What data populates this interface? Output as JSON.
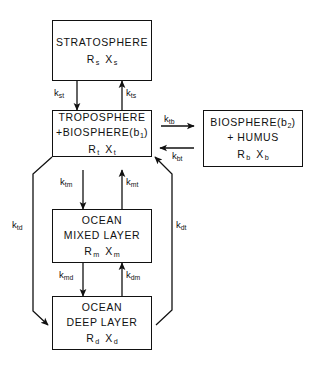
{
  "diagram": {
    "type": "box-and-arrow compartment model",
    "nodes": [
      {
        "id": "stratosphere",
        "name": "STRATOSPHERE",
        "lines": [
          "STRATOSPHERE"
        ],
        "reservoir_symbol": "R",
        "reservoir_sub": "s",
        "tracer_symbol": "X",
        "tracer_sub": "s"
      },
      {
        "id": "troposphere",
        "name": "TROPOSPHERE +BIOSPHERE(b1)",
        "lines": [
          "TROPOSPHERE",
          "+BIOSPHERE(b"
        ],
        "line1": "TROPOSPHERE",
        "line2_pre": "+BIOSPHERE(b",
        "line2_sub": "1",
        "line2_post": ")",
        "reservoir_symbol": "R",
        "reservoir_sub": "t",
        "tracer_symbol": "X",
        "tracer_sub": "t"
      },
      {
        "id": "biosphere",
        "name": "BIOSPHERE(b2) + HUMUS",
        "line1_pre": "BIOSPHERE(b",
        "line1_sub": "2",
        "line1_post": ")",
        "line2": "+ HUMUS",
        "reservoir_symbol": "R",
        "reservoir_sub": "b",
        "tracer_symbol": "X",
        "tracer_sub": "b"
      },
      {
        "id": "ocean-mixed-layer",
        "name": "OCEAN MIXED LAYER",
        "line1": "OCEAN",
        "line2": "MIXED  LAYER",
        "reservoir_symbol": "R",
        "reservoir_sub": "m",
        "tracer_symbol": "X",
        "tracer_sub": "m"
      },
      {
        "id": "ocean-deep-layer",
        "name": "OCEAN DEEP LAYER",
        "line1": "OCEAN",
        "line2": "DEEP  LAYER",
        "reservoir_symbol": "R",
        "reservoir_sub": "d",
        "tracer_symbol": "X",
        "tracer_sub": "d"
      }
    ],
    "rates": [
      {
        "id": "k-st",
        "symbol": "k",
        "sub": "st",
        "from": "stratosphere",
        "to": "troposphere",
        "direction": "down"
      },
      {
        "id": "k-ts",
        "symbol": "k",
        "sub": "ts",
        "from": "troposphere",
        "to": "stratosphere",
        "direction": "up"
      },
      {
        "id": "k-tb",
        "symbol": "k",
        "sub": "tb",
        "from": "troposphere",
        "to": "biosphere",
        "direction": "right"
      },
      {
        "id": "k-bt",
        "symbol": "k",
        "sub": "bt",
        "from": "biosphere",
        "to": "troposphere",
        "direction": "left"
      },
      {
        "id": "k-tm",
        "symbol": "k",
        "sub": "tm",
        "from": "troposphere",
        "to": "ocean-mixed-layer",
        "direction": "down"
      },
      {
        "id": "k-mt",
        "symbol": "k",
        "sub": "mt",
        "from": "ocean-mixed-layer",
        "to": "troposphere",
        "direction": "up"
      },
      {
        "id": "k-md",
        "symbol": "k",
        "sub": "md",
        "from": "ocean-mixed-layer",
        "to": "ocean-deep-layer",
        "direction": "down"
      },
      {
        "id": "k-dm",
        "symbol": "k",
        "sub": "dm",
        "from": "ocean-deep-layer",
        "to": "ocean-mixed-layer",
        "direction": "up"
      },
      {
        "id": "k-td",
        "symbol": "k",
        "sub": "td",
        "from": "troposphere",
        "to": "ocean-deep-layer",
        "direction": "down-bypass-left"
      },
      {
        "id": "k-dt",
        "symbol": "k",
        "sub": "dt",
        "from": "ocean-deep-layer",
        "to": "troposphere",
        "direction": "up-bypass-right"
      }
    ]
  },
  "colors": {
    "stroke": "#111111",
    "background": "#ffffff"
  }
}
